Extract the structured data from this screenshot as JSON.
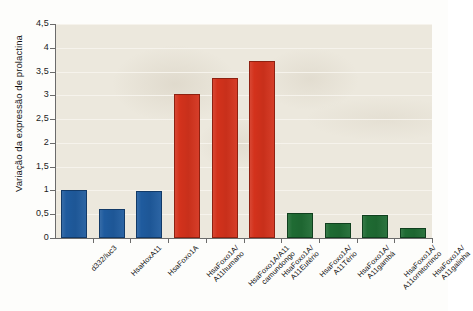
{
  "chart_data": {
    "type": "bar",
    "title": "",
    "xlabel": "",
    "ylabel": "Variação da expressão de prolactina",
    "ylim": [
      0,
      4.5
    ],
    "ytick_labels": [
      "0",
      "0,5",
      "1",
      "1,5",
      "2",
      "2,5",
      "3",
      "3,5",
      "4",
      "4,5"
    ],
    "ytick_values": [
      0,
      0.5,
      1,
      1.5,
      2,
      2.5,
      3,
      3.5,
      4,
      4.5
    ],
    "grid": true,
    "legend": "none",
    "categories": [
      "d332/luc3",
      "HsaHoxA11",
      "HsaFoxo1A",
      "HsaFoxo1A/A11humano",
      "HsaFoxo1A/A11camundongo",
      "HsaFoxo1A/A11Eutério",
      "HsaFoxo1A/A11Tério",
      "HsaFoxo1A/A11gambá",
      "HsaFoxo1A/A11ornitorrinco",
      "HsaFoxo1A/A11galinha"
    ],
    "category_lines": [
      [
        "d332/luc3"
      ],
      [
        "HsaHoxA11"
      ],
      [
        "HsaFoxo1A"
      ],
      [
        "HsaFoxo1A/",
        "A11humano"
      ],
      [
        "HsaFoxo1A/A11",
        "camundongo"
      ],
      [
        "HsaFoxo1A/",
        "A11Eutério"
      ],
      [
        "HsaFoxo1A/",
        "A11Tério"
      ],
      [
        "HsaFoxo1A/",
        "A11gambá"
      ],
      [
        "HsaFoxo1A/",
        "A11ornitorrinco"
      ],
      [
        "HsaFoxo1A/",
        "A11galinha"
      ]
    ],
    "values": [
      1.0,
      0.6,
      0.98,
      3.02,
      3.37,
      3.72,
      0.52,
      0.31,
      0.48,
      0.22
    ],
    "colors": [
      "#1f5b9e",
      "#1f5b9e",
      "#1f5b9e",
      "#d3321c",
      "#d3321c",
      "#d3321c",
      "#1f6b33",
      "#1f6b33",
      "#1f6b33",
      "#1f6b33"
    ],
    "color_names": [
      "blue",
      "blue",
      "blue",
      "red",
      "red",
      "red",
      "green",
      "green",
      "green",
      "green"
    ],
    "plot_background": "#ece8dd"
  }
}
